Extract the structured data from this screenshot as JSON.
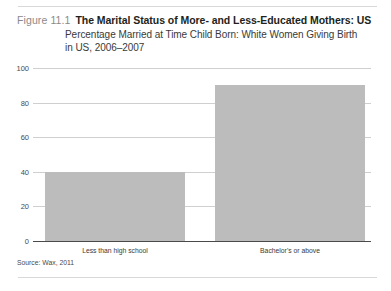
{
  "figure": {
    "number_label": "Figure 11.1",
    "title": "The Marital Status of More- and Less-Educated Mothers: US",
    "subtitle": "Percentage Married at Time Child Born: White Women Giving Birth in US, 2006–2007",
    "source": "Source: Wax, 2011"
  },
  "colors": {
    "bar_fill": "#bcbcbc",
    "gridline": "#cfcfcf",
    "axis": "#4a4a4a",
    "rule": "#d8d8d8",
    "title_text": "#231f20",
    "figure_number_text": "#8a8a8a"
  },
  "chart_data": {
    "type": "bar",
    "title": "The Marital Status of More- and Less-Educated Mothers: US",
    "subtitle": "Percentage Married at Time Child Born: White Women Giving Birth in US, 2006–2007",
    "categories": [
      "Less than high school",
      "Bachelor's or above"
    ],
    "values": [
      40,
      90
    ],
    "xlabel": "",
    "ylabel": "",
    "ylim": [
      0,
      100
    ],
    "yticks": [
      0,
      20,
      40,
      60,
      80,
      100
    ],
    "ytick_labels": [
      "0",
      "20",
      "40",
      "60",
      "80",
      "100"
    ],
    "grid": true,
    "legend": false,
    "source": "Source: Wax, 2011"
  }
}
